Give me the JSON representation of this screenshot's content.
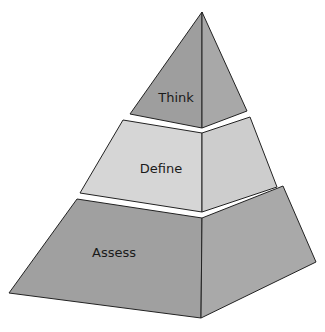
{
  "diagram": {
    "type": "pyramid",
    "levels": [
      {
        "label": "Think",
        "position": "top",
        "front_color": "#9e9e9e",
        "side_color": "#a8a8a8"
      },
      {
        "label": "Define",
        "position": "middle",
        "front_color": "#d6d6d6",
        "side_color": "#cdcdcd"
      },
      {
        "label": "Assess",
        "position": "bottom",
        "front_color": "#a0a0a0",
        "side_color": "#a9a9a9"
      }
    ],
    "outline_color": "#222222",
    "gap_color": "#ffffff"
  }
}
